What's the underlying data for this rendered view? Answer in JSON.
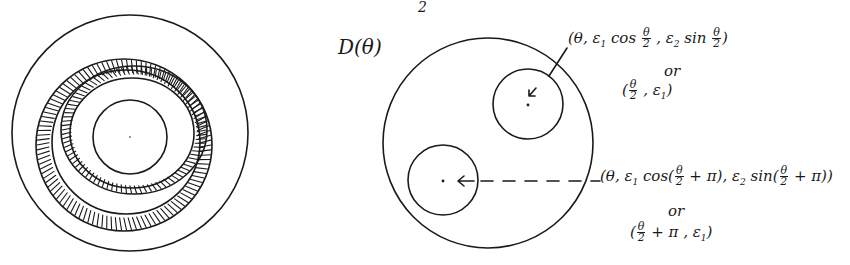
{
  "colors": {
    "ink": "#1a1a1a",
    "background": "#ffffff"
  },
  "page_fragment": "2",
  "left_figure": {
    "description": "Solid torus cross-section with two hatched bands spiraling around a central disk",
    "outer_circle": {
      "cx": 130,
      "cy": 133,
      "r": 118
    },
    "inner_circle": {
      "cx": 130,
      "cy": 137,
      "r": 37
    },
    "center_dot": {
      "cx": 130,
      "cy": 137
    }
  },
  "right_figure": {
    "title": "D(θ)",
    "outer_circle": {
      "cx": 488,
      "cy": 143,
      "r": 105
    },
    "upper_disk": {
      "cx": 528,
      "cy": 104,
      "r": 35
    },
    "lower_disk": {
      "cx": 443,
      "cy": 180,
      "r": 35
    },
    "upper_label": {
      "line1": "(θ, ε₁ cos θ/2 , ε₂ sin θ/2)",
      "line1_parts": {
        "open": "(θ, ε",
        "sub1": "1",
        "cos": " cos ",
        "frac_num": "θ",
        "frac_den": "2",
        "sep": " , ε",
        "sub2": "2",
        "sin": " sin ",
        "close": ")"
      },
      "or": "or",
      "line2": "(θ/2 , ε₁)",
      "line2_parts": {
        "open": "(",
        "frac_num": "θ",
        "frac_den": "2",
        "sep": " , ε",
        "sub": "1",
        "close": ")"
      }
    },
    "lower_label": {
      "line1": "(θ, ε₁ cos(θ/2 + π), ε₂ sin(θ/2 + π))",
      "line1_parts": {
        "open": "(θ, ε",
        "sub1": "1",
        "cos": " cos(",
        "frac_num": "θ",
        "frac_den": "2",
        "plus_pi": " + π), ε",
        "sub2": "2",
        "sin": " sin(",
        "plus_pi2": " + π))"
      },
      "or": "or",
      "line2": "(θ/2 + π, ε₁)",
      "line2_parts": {
        "open": "(",
        "frac_num": "θ",
        "frac_den": "2",
        "rest": " + π , ε",
        "sub": "1",
        "close": ")"
      }
    }
  }
}
